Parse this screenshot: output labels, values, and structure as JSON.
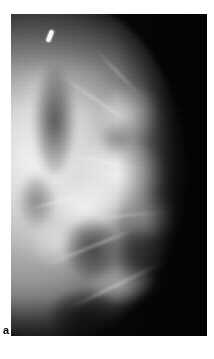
{
  "figure": {
    "panel_label": "a",
    "modality_name": "mammogram-radiograph",
    "view_description": "lateral breast radiograph",
    "background_color": "#ffffff",
    "film_color": "#050505",
    "tissue_highlight_color": "#f2f2f2"
  },
  "radiograph": {
    "image_name": "breast-mammogram-image",
    "alt_text": "Mammogram showing dense fibroglandular breast tissue with scattered fatty lobules",
    "frame": {
      "left_px": 11,
      "top_px": 14,
      "width_px": 196,
      "height_px": 322
    }
  },
  "annotations": {
    "skin_marker": {
      "name": "radiopaque-skin-marker",
      "color": "#fdfdfd",
      "description": "bright linear radiopaque marker in upper breast"
    }
  }
}
